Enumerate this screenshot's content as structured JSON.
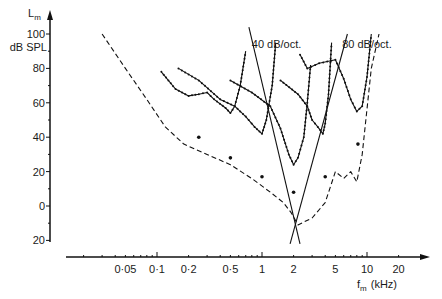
{
  "chart_data": {
    "type": "line",
    "title": "",
    "xlabel": "f_m (kHz)",
    "ylabel": "L_m dB SPL",
    "x_scale": "log",
    "xlim": [
      0.017,
      30
    ],
    "ylim": [
      -22,
      104
    ],
    "grid": false,
    "legend": "none",
    "y_ticks": [
      100,
      80,
      60,
      40,
      20,
      0,
      -20
    ],
    "y_tick_labels": [
      "100",
      "80",
      "60",
      "40",
      "20",
      "0",
      "20"
    ],
    "x_ticks": [
      0.05,
      0.1,
      0.2,
      0.5,
      1,
      2,
      5,
      10,
      20
    ],
    "x_tick_labels": [
      "0·05",
      "0·1",
      "0·2",
      "0·5",
      "1",
      "2",
      "5",
      "10",
      "20"
    ],
    "annotations": [
      {
        "text": "40 dB/oct.",
        "x": 0.8,
        "y": 92
      },
      {
        "text": "80 dB/oct.",
        "x": 5.8,
        "y": 92
      }
    ],
    "series": [
      {
        "name": "threshold (dashed)",
        "style": "dashed",
        "points": [
          [
            0.03,
            100
          ],
          [
            0.05,
            80
          ],
          [
            0.08,
            62
          ],
          [
            0.12,
            46
          ],
          [
            0.18,
            36
          ],
          [
            0.3,
            30
          ],
          [
            0.5,
            24
          ],
          [
            0.8,
            16
          ],
          [
            1.2,
            8
          ],
          [
            1.6,
            2
          ],
          [
            1.9,
            -4
          ],
          [
            2.2,
            -11
          ],
          [
            3,
            -7
          ],
          [
            4,
            2
          ],
          [
            5,
            20
          ],
          [
            6,
            16
          ],
          [
            7,
            20
          ],
          [
            8,
            14
          ],
          [
            9,
            30
          ],
          [
            11,
            80
          ],
          [
            13,
            100
          ]
        ]
      },
      {
        "name": "tuning curve 1 (CF ~0.5 kHz)",
        "style": "solid-dots",
        "points": [
          [
            0.11,
            78
          ],
          [
            0.15,
            68
          ],
          [
            0.2,
            64
          ],
          [
            0.25,
            65
          ],
          [
            0.3,
            66
          ],
          [
            0.35,
            62
          ],
          [
            0.45,
            57
          ],
          [
            0.5,
            54
          ],
          [
            0.55,
            58
          ],
          [
            0.62,
            70
          ],
          [
            0.7,
            90
          ]
        ]
      },
      {
        "name": "tuning curve 2 (CF ~1 kHz)",
        "style": "solid-dots",
        "points": [
          [
            0.16,
            80
          ],
          [
            0.25,
            73
          ],
          [
            0.4,
            62
          ],
          [
            0.55,
            58
          ],
          [
            0.7,
            52
          ],
          [
            0.85,
            46
          ],
          [
            1.0,
            42
          ],
          [
            1.1,
            50
          ],
          [
            1.25,
            70
          ],
          [
            1.35,
            95
          ]
        ]
      },
      {
        "name": "tuning curve 3 (CF ~2 kHz)",
        "style": "solid-dots",
        "points": [
          [
            0.5,
            73
          ],
          [
            0.8,
            66
          ],
          [
            1.2,
            58
          ],
          [
            1.5,
            45
          ],
          [
            1.8,
            30
          ],
          [
            2.0,
            24
          ],
          [
            2.2,
            28
          ],
          [
            2.5,
            40
          ],
          [
            2.7,
            60
          ],
          [
            2.9,
            82
          ]
        ]
      },
      {
        "name": "tuning curve 4 (CF ~4 kHz)",
        "style": "solid-dots",
        "points": [
          [
            1.5,
            73
          ],
          [
            2.2,
            65
          ],
          [
            2.7,
            58
          ],
          [
            3.0,
            50
          ],
          [
            3.4,
            46
          ],
          [
            3.8,
            42
          ],
          [
            4.0,
            48
          ],
          [
            4.3,
            65
          ],
          [
            4.6,
            95
          ]
        ]
      },
      {
        "name": "tuning curve 5 (CF ~8 kHz)",
        "style": "solid-dots",
        "points": [
          [
            2.3,
            88
          ],
          [
            2.7,
            80
          ],
          [
            3.5,
            83
          ],
          [
            5,
            85
          ],
          [
            6,
            74
          ],
          [
            7,
            62
          ],
          [
            8,
            55
          ],
          [
            9,
            58
          ],
          [
            10,
            75
          ],
          [
            11,
            100
          ]
        ]
      },
      {
        "name": "best thresholds (dots)",
        "style": "markers",
        "points": [
          [
            0.25,
            40
          ],
          [
            0.5,
            28
          ],
          [
            1.0,
            17
          ],
          [
            2.0,
            8
          ],
          [
            4.0,
            17
          ],
          [
            8.2,
            36
          ]
        ]
      },
      {
        "name": "40 dB/oct. line",
        "style": "line",
        "points": [
          [
            0.75,
            104
          ],
          [
            2.3,
            -22
          ]
        ]
      },
      {
        "name": "80 dB/oct. line",
        "style": "line",
        "points": [
          [
            1.85,
            -22
          ],
          [
            6.5,
            100
          ]
        ]
      }
    ]
  },
  "axes": {
    "y_title_main": "L",
    "y_title_sub": "m",
    "y_unit": "dB SPL",
    "x_title_main": "f",
    "x_title_sub": "m",
    "x_unit": "(kHz)"
  }
}
